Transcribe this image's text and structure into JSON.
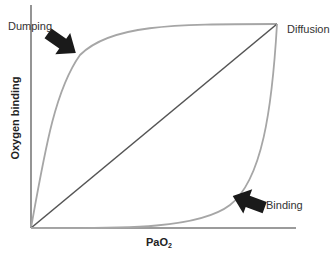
{
  "diagram": {
    "type": "oxygen-binding-curves",
    "axes": {
      "y_label": "Oxygen binding",
      "x_label_main": "PaO",
      "x_label_sub": "2"
    },
    "curves": [
      {
        "name": "dumping",
        "label": "Dumping",
        "shape": "concave-down",
        "color": "#a6a6a6"
      },
      {
        "name": "diffusion",
        "label": "Diffusion",
        "shape": "linear",
        "color": "#555555"
      },
      {
        "name": "binding",
        "label": "Binding",
        "shape": "concave-up",
        "color": "#a6a6a6"
      }
    ],
    "arrows": [
      {
        "name": "dumping-arrow",
        "points_to": "Dumping",
        "direction": "down-right",
        "color": "#1a1a1a"
      },
      {
        "name": "binding-arrow",
        "points_to": "Binding",
        "direction": "up-left",
        "color": "#1a1a1a"
      }
    ],
    "colors": {
      "axis": "#7a7a7a",
      "background": "#ffffff",
      "text": "#333333"
    }
  }
}
